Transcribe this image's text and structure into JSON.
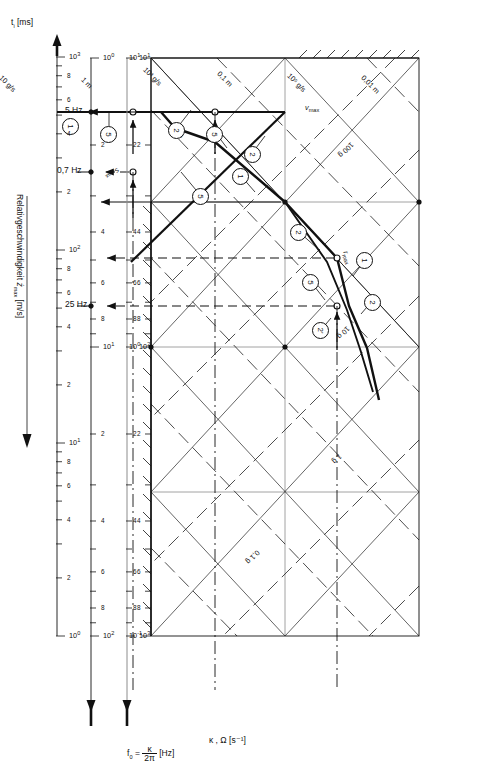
{
  "figure": {
    "type": "nomogram",
    "orientation": "rotated-90-cw"
  },
  "axes": {
    "y_axis": {
      "label_text": "Relativgeschwindigkeit",
      "label_symbol": "ż",
      "label_symbol_sub": "max",
      "label_unit": "[m/s]",
      "ticks": [
        "10",
        "8",
        "6",
        "4",
        "2",
        "10",
        "8",
        "6",
        "4",
        "2",
        "10"
      ],
      "tick_decades": [
        "10¹",
        "10⁰",
        "10⁻¹"
      ],
      "top": "10¹",
      "bottom": "10⁻¹"
    },
    "kappa_axis": {
      "label": "κ , Ω [s⁻¹]",
      "symbol": "κ",
      "symbol2": "Ω",
      "unit": "[s⁻¹]",
      "decades": [
        "10¹",
        "10²",
        "10³"
      ],
      "minor": [
        "2",
        "4",
        "6",
        "8"
      ]
    },
    "f0_axis": {
      "label_lhs": "f",
      "label_lhs_sub": "0",
      "label_eq": "=",
      "label_num": "κ",
      "label_den": "2π",
      "label_unit": "[Hz]",
      "decades": [
        "10⁰",
        "10¹",
        "10²"
      ],
      "minor": [
        "2",
        "4",
        "6",
        "8"
      ]
    },
    "ti_axis": {
      "label": "t",
      "label_sub": "i",
      "unit": "[ms]",
      "decades": [
        "10⁰",
        "10¹",
        "10²",
        "10³"
      ],
      "minor": [
        "2",
        "4",
        "6",
        "8"
      ]
    }
  },
  "frequency_markers": [
    {
      "label": "25 Hz"
    },
    {
      "label": "5 Hz"
    },
    {
      "label": "0,7 Hz"
    }
  ],
  "diagonal_labels": {
    "displacement": [
      {
        "text": "0,01 m"
      },
      {
        "text": "0,1 m"
      },
      {
        "text": "1 m"
      }
    ],
    "jerk": [
      {
        "text": "10⁵ g/s"
      },
      {
        "text": "10³ g/s"
      },
      {
        "text": "10 g/s"
      }
    ],
    "acceleration": [
      {
        "text": "100 g"
      },
      {
        "text": "10 g"
      },
      {
        "text": "1 g"
      },
      {
        "text": "0,1 g"
      }
    ]
  },
  "curve_labels": [
    {
      "text": "a",
      "sub": "max"
    },
    {
      "text": "r",
      "sub": "max"
    },
    {
      "text": "v",
      "sub": "max"
    },
    {
      "text": "s",
      "sub": "max"
    }
  ],
  "callouts": [
    {
      "id": "c1",
      "text": "1"
    },
    {
      "id": "c2",
      "text": "2"
    },
    {
      "id": "c3",
      "text": "2"
    },
    {
      "id": "c4",
      "text": "5"
    },
    {
      "id": "c5",
      "text": "1"
    },
    {
      "id": "c6",
      "text": "2"
    },
    {
      "id": "c7",
      "text": "5"
    },
    {
      "id": "c8",
      "text": "2'"
    },
    {
      "id": "c9",
      "text": "1"
    },
    {
      "id": "c10",
      "text": "2"
    },
    {
      "id": "c11",
      "text": "5"
    },
    {
      "id": "c12",
      "text": "5"
    }
  ],
  "scale_minor_labels": [
    "2",
    "4",
    "6",
    "8"
  ],
  "colors": {
    "ink": "#111111",
    "paper": "#ffffff",
    "rule": "#808080"
  }
}
